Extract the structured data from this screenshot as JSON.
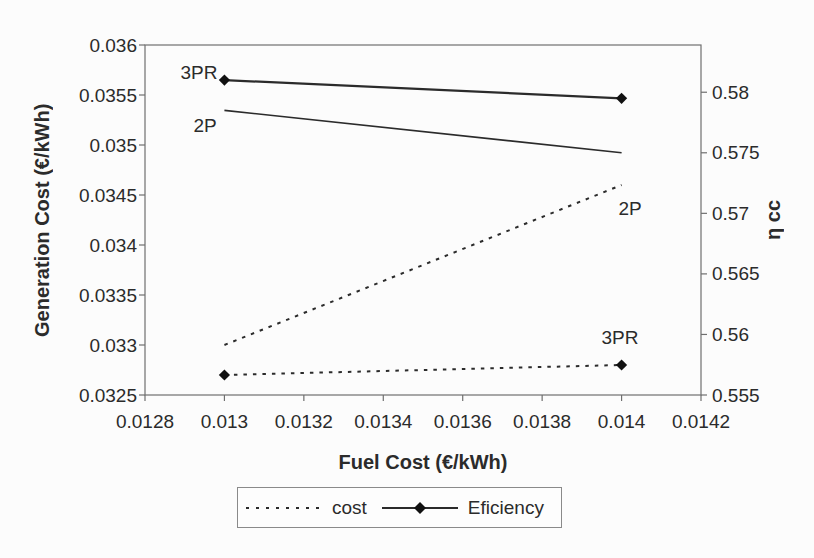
{
  "chart_data": {
    "type": "line",
    "title": "",
    "xlabel": "Fuel Cost (€/kWh)",
    "ylabel_left": "Generation Cost (€/kWh)",
    "ylabel_right": "η cc",
    "grid": false,
    "legend_position": "bottom",
    "x_axis": {
      "min": 0.0128,
      "max": 0.0142,
      "tick_values": [
        0.0128,
        0.013,
        0.0132,
        0.0134,
        0.0136,
        0.0138,
        0.014,
        0.0142
      ],
      "tick_labels": [
        "0.0128",
        "0.013",
        "0.0132",
        "0.0134",
        "0.0136",
        "0.0138",
        "0.014",
        "0.0142"
      ]
    },
    "left_axis": {
      "min": 0.0325,
      "max": 0.036,
      "tick_values": [
        0.036,
        0.0355,
        0.035,
        0.0345,
        0.034,
        0.0335,
        0.033,
        0.0325
      ],
      "tick_labels": [
        "0.036",
        "0.0355",
        "0.035",
        "0.0345",
        "0.034",
        "0.0335",
        "0.033",
        "0.0325"
      ]
    },
    "right_axis": {
      "min": 0.555,
      "max": 0.5839,
      "tick_values": [
        0.58,
        0.575,
        0.57,
        0.565,
        0.56,
        0.555
      ],
      "tick_labels": [
        "0.58",
        "0.575",
        "0.57",
        "0.565",
        "0.56",
        "0.555"
      ]
    },
    "series": [
      {
        "id": "cost-2P",
        "group": "cost",
        "plant": "2P",
        "axis": "left",
        "style": "dashed",
        "marker": false,
        "width": 2,
        "x": [
          0.013,
          0.014
        ],
        "y": [
          0.033,
          0.0346
        ]
      },
      {
        "id": "cost-3PR",
        "group": "cost",
        "plant": "3PR",
        "axis": "left",
        "style": "dashed",
        "marker": true,
        "width": 2,
        "x": [
          0.013,
          0.014
        ],
        "y": [
          0.0327,
          0.0328
        ]
      },
      {
        "id": "eff-2P",
        "group": "efficiency",
        "plant": "2P",
        "axis": "right",
        "style": "solid",
        "marker": false,
        "width": 1.6,
        "x": [
          0.013,
          0.014
        ],
        "y": [
          0.5785,
          0.575
        ]
      },
      {
        "id": "eff-3PR",
        "group": "efficiency",
        "plant": "3PR",
        "axis": "right",
        "style": "solid",
        "marker": true,
        "width": 2.2,
        "x": [
          0.013,
          0.014
        ],
        "y": [
          0.581,
          0.5795
        ]
      }
    ],
    "annotations": [
      {
        "text": "3PR",
        "x_px": 199,
        "y_px": 79
      },
      {
        "text": "2P",
        "x_px": 205,
        "y_px": 132
      },
      {
        "text": "2P",
        "x_px": 630,
        "y_px": 215
      },
      {
        "text": "3PR",
        "x_px": 620,
        "y_px": 344
      }
    ],
    "legend": [
      {
        "label": "cost",
        "style": "dashed",
        "marker": false
      },
      {
        "label": "Eficiency",
        "style": "solid",
        "marker": true
      }
    ],
    "colors": {
      "series_line": "#2b2b2b",
      "marker_fill": "#111111",
      "frame": "#6f6f6f",
      "text": "#2b2b2b",
      "legend_border": "#8a8a8a",
      "background": "#fcfcfc"
    }
  }
}
